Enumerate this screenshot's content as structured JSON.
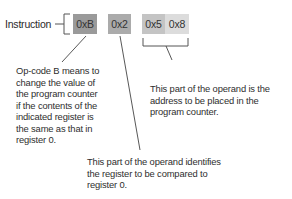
{
  "instruction_label": "Instruction",
  "fields": [
    {
      "id": "opcode",
      "text": "0xB",
      "color": "#9a9a9a"
    },
    {
      "id": "register",
      "text": "0x2",
      "color": "#ababab"
    },
    {
      "id": "address-high",
      "text": "0x5",
      "color": "#c4c4c4"
    },
    {
      "id": "address-low",
      "text": "0x8",
      "color": "#dcdcdc"
    }
  ],
  "annotations": {
    "opcode": [
      "Op-code B means to",
      "change the value of",
      "the program counter",
      "if the contents of the",
      "indicated register is",
      "the same as that in",
      "register 0."
    ],
    "address": [
      "This part of the operand is the",
      "address to be placed in the",
      "program counter."
    ],
    "register": [
      "This part of the operand identifies",
      "the register to be compared to",
      "register 0."
    ]
  }
}
